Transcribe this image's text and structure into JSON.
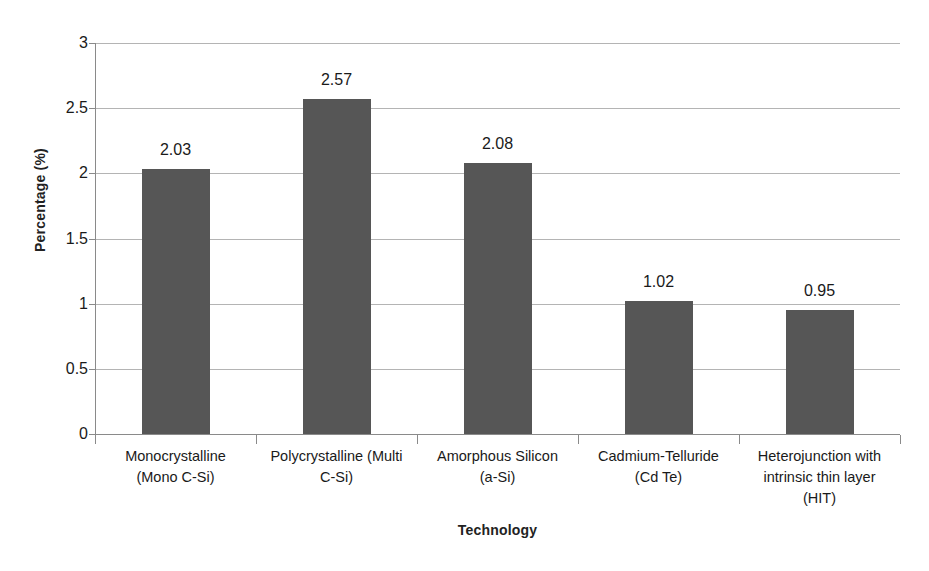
{
  "chart_data": {
    "type": "bar",
    "title": "",
    "subtitle": "",
    "xlabel": "Technology",
    "ylabel": "Percentage (%)",
    "categories": [
      "Monocrystalline (Mono C-Si)",
      "Polycrystalline (Multi C-Si)",
      "Amorphous Silicon (a-Si)",
      "Cadmium-Telluride (Cd Te)",
      "Heterojunction with intrinsic thin layer (HIT)"
    ],
    "category_lines": [
      [
        "Monocrystalline",
        "(Mono C-Si)"
      ],
      [
        "Polycrystalline (Multi",
        "C-Si)"
      ],
      [
        "Amorphous Silicon",
        "(a-Si)"
      ],
      [
        "Cadmium-Telluride",
        "(Cd Te)"
      ],
      [
        "Heterojunction with",
        "intrinsic thin layer",
        "(HIT)"
      ]
    ],
    "values": [
      2.03,
      2.57,
      2.08,
      1.02,
      0.95
    ],
    "value_labels": [
      "2.03",
      "2.57",
      "2.08",
      "1.02",
      "0.95"
    ],
    "ylim": [
      0,
      3
    ],
    "ytick_values": [
      0,
      0.5,
      1,
      1.5,
      2,
      2.5,
      3
    ],
    "ytick_labels": [
      "0",
      "0.5",
      "1",
      "1.5",
      "2",
      "2.5",
      "3"
    ],
    "grid": "horizontal",
    "legend": "none",
    "bar_color": "#565656",
    "gridline_color": "#b4b4b4",
    "axis_color": "#8a8a8a",
    "background_color": "#ffffff",
    "text_color": "#1a1a1a"
  }
}
